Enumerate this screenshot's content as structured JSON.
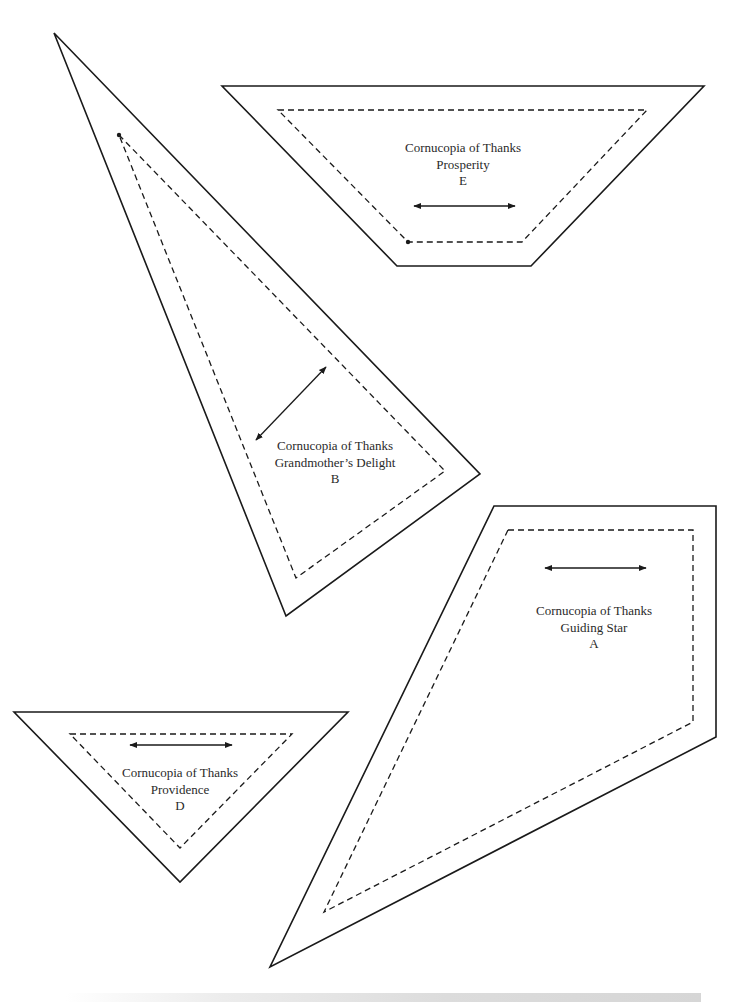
{
  "page": {
    "background": "#ffffff",
    "stroke_color": "#1a1a1a",
    "text_color": "#2a2a2a"
  },
  "pieces": [
    {
      "id": "E",
      "pattern": "Cornucopia of Thanks",
      "block": "Prosperity",
      "letter": "E",
      "shape": "trapezoid",
      "outline": [
        [
          222,
          86
        ],
        [
          704,
          86
        ],
        [
          531,
          266
        ],
        [
          397,
          266
        ]
      ],
      "seam": [
        [
          278,
          110
        ],
        [
          647,
          110
        ],
        [
          522,
          242
        ],
        [
          408,
          242
        ]
      ],
      "seam_dot": [
        408,
        242
      ],
      "grain_arrow": [
        [
          414,
          206
        ],
        [
          515,
          206
        ]
      ],
      "label_center": [
        463,
        140
      ]
    },
    {
      "id": "B",
      "pattern": "Cornucopia of Thanks",
      "block": "Grandmother’s Delight",
      "letter": "B",
      "shape": "triangle",
      "outline": [
        [
          54,
          33
        ],
        [
          480,
          474
        ],
        [
          286,
          616
        ]
      ],
      "seam": [
        [
          119,
          135
        ],
        [
          445,
          471
        ],
        [
          296,
          578
        ]
      ],
      "seam_dot": [
        119,
        135
      ],
      "grain_arrow": [
        [
          256,
          440
        ],
        [
          326,
          367
        ]
      ],
      "label_center": [
        335,
        438
      ]
    },
    {
      "id": "A",
      "pattern": "Cornucopia of Thanks",
      "block": "Guiding Star",
      "letter": "A",
      "shape": "quadrilateral",
      "outline": [
        [
          494,
          506
        ],
        [
          716,
          506
        ],
        [
          716,
          737
        ],
        [
          270,
          967
        ]
      ],
      "seam": [
        [
          508,
          530
        ],
        [
          693,
          530
        ],
        [
          693,
          722
        ],
        [
          324,
          912
        ]
      ],
      "grain_arrow": [
        [
          545,
          568
        ],
        [
          646,
          568
        ]
      ],
      "label_center": [
        594,
        603
      ]
    },
    {
      "id": "D",
      "pattern": "Cornucopia of Thanks",
      "block": "Providence",
      "letter": "D",
      "shape": "triangle",
      "outline": [
        [
          14,
          712
        ],
        [
          348,
          712
        ],
        [
          180,
          882
        ]
      ],
      "seam": [
        [
          70,
          734
        ],
        [
          292,
          734
        ],
        [
          180,
          848
        ]
      ],
      "grain_arrow": [
        [
          130,
          745
        ],
        [
          232,
          745
        ]
      ],
      "label_center": [
        180,
        765
      ]
    }
  ],
  "labels": {
    "E": {
      "line1": "Cornucopia of Thanks",
      "line2": "Prosperity",
      "line3": "E"
    },
    "B": {
      "line1": "Cornucopia of Thanks",
      "line2": "Grandmother’s Delight",
      "line3": "B"
    },
    "A": {
      "line1": "Cornucopia of Thanks",
      "line2": "Guiding Star",
      "line3": "A"
    },
    "D": {
      "line1": "Cornucopia of Thanks",
      "line2": "Providence",
      "line3": "D"
    }
  }
}
